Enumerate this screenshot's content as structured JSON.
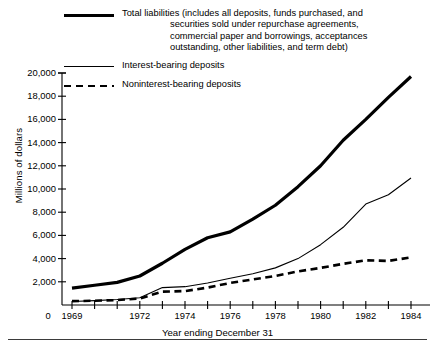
{
  "chart_data": {
    "type": "line",
    "title": "",
    "xlabel": "Year ending December 31",
    "ylabel": "Millions of dollars",
    "ylim": [
      0,
      20000
    ],
    "xlim": [
      1968.3,
      1984.9
    ],
    "grid": false,
    "legend_position": "top",
    "ytick_labels": [
      "20,000",
      "18,000",
      "16,000",
      "14,000",
      "12,000",
      "10,000",
      "8,000",
      "6,000",
      "4,000",
      "2,000"
    ],
    "ytick_values": [
      20000,
      18000,
      16000,
      14000,
      12000,
      10000,
      8000,
      6000,
      4000,
      2000
    ],
    "xtick_labels": [
      "0",
      "1969",
      "1972",
      "1974",
      "1976",
      "1978",
      "1980",
      "1982",
      "1984"
    ],
    "xtick_values": [
      1968.3,
      1969,
      1972,
      1974,
      1976,
      1978,
      1980,
      1982,
      1984
    ],
    "x": [
      1969,
      1970,
      1971,
      1972,
      1973,
      1974,
      1975,
      1976,
      1977,
      1978,
      1979,
      1980,
      1981,
      1982,
      1983,
      1984
    ],
    "series": [
      {
        "name": "Total liabilities (includes all deposits, funds purchased, and securities sold under repurchase agreements, commercial paper and borrowings, acceptances outstanding, other liabilities, and term debt)",
        "short_name": "Total liabilities",
        "style": "thick-solid",
        "color": "#000000",
        "values": [
          1450,
          1700,
          1950,
          2500,
          3600,
          4800,
          5800,
          6300,
          7400,
          8600,
          10200,
          12000,
          14200,
          16000,
          17900,
          19700
        ]
      },
      {
        "name": "Interest-bearing deposits",
        "short_name": "Interest-bearing deposits",
        "style": "thin-solid",
        "color": "#000000",
        "values": [
          300,
          380,
          470,
          620,
          1500,
          1580,
          1900,
          2300,
          2700,
          3200,
          4000,
          5200,
          6700,
          8700,
          9500,
          10950
        ]
      },
      {
        "name": "Noninterest-bearing deposits",
        "short_name": "Noninterest-bearing deposits",
        "style": "dashed",
        "color": "#000000",
        "values": [
          330,
          370,
          420,
          560,
          1150,
          1200,
          1500,
          1900,
          2200,
          2500,
          2900,
          3200,
          3550,
          3850,
          3800,
          4100
        ]
      }
    ]
  },
  "legend": [
    {
      "label_line1": "Total liabilities (includes all deposits, funds purchased, and",
      "label_line2": "securities sold under repurchase agreements,",
      "label_line3": "commercial paper and borrowings, acceptances",
      "label_line4": "outstanding, other liabilities, and term debt)",
      "swatch": "thick-solid-line-icon"
    },
    {
      "label_line1": "Interest-bearing deposits",
      "swatch": "thin-solid-line-icon"
    },
    {
      "label_line1": "Noninterest-bearing deposits",
      "swatch": "dashed-line-icon"
    }
  ]
}
